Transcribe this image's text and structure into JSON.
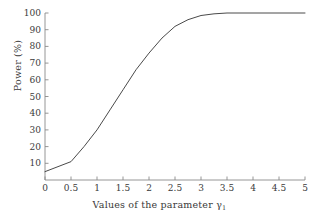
{
  "chart_data": {
    "type": "line",
    "title": "",
    "xlabel": "Values of the parameter γ",
    "xlabel_subscript": "1",
    "ylabel": "Power (%)",
    "xlim": [
      0,
      5
    ],
    "ylim": [
      0,
      100
    ],
    "grid": false,
    "legend": null,
    "xticks": [
      "0",
      "0.5",
      "1",
      "1.5",
      "2",
      "2.5",
      "3",
      "3.5",
      "4",
      "4.5",
      "5"
    ],
    "xtick_values": [
      0,
      0.5,
      1,
      1.5,
      2,
      2.5,
      3,
      3.5,
      4,
      4.5,
      5
    ],
    "yticks": [
      "10",
      "20",
      "30",
      "40",
      "50",
      "60",
      "70",
      "80",
      "90",
      "100"
    ],
    "ytick_values": [
      10,
      20,
      30,
      40,
      50,
      60,
      70,
      80,
      90,
      100
    ],
    "line_color": "#4a4a4a",
    "line_width": 1,
    "axis_color": "#8a8a8a",
    "x": [
      0,
      0.5,
      0.75,
      1,
      1.25,
      1.5,
      1.75,
      2,
      2.25,
      2.5,
      2.75,
      3,
      3.25,
      3.5,
      4,
      4.5,
      5
    ],
    "y": [
      5,
      11,
      20,
      30,
      42,
      54,
      66,
      76,
      85,
      92,
      96,
      98.5,
      99.5,
      100,
      100,
      100,
      100
    ],
    "series": [
      {
        "name": "Power",
        "points": [
          [
            0,
            5
          ],
          [
            0.5,
            11
          ],
          [
            0.75,
            20
          ],
          [
            1,
            30
          ],
          [
            1.25,
            42
          ],
          [
            1.5,
            54
          ],
          [
            1.75,
            66
          ],
          [
            2,
            76
          ],
          [
            2.25,
            85
          ],
          [
            2.5,
            92
          ],
          [
            2.75,
            96
          ],
          [
            3,
            98.5
          ],
          [
            3.25,
            99.5
          ],
          [
            3.5,
            100
          ],
          [
            4,
            100
          ],
          [
            4.5,
            100
          ],
          [
            5,
            100
          ]
        ]
      }
    ]
  }
}
